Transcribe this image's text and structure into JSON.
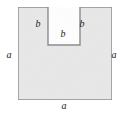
{
  "figure": {
    "kind": "geometry-diagram",
    "shape_name": "u-shaped-polygon",
    "colors": {
      "fill": "#e8e8e8",
      "stroke": "#8a8a8a",
      "label": "#1c1c1c",
      "background": "#ffffff"
    },
    "canvas": {
      "width": 122,
      "height": 115
    },
    "outline": {
      "outer_left": 18,
      "outer_right": 112,
      "outer_top": 7,
      "outer_bottom": 100,
      "notch_left": 48,
      "notch_right": 80,
      "notch_bottom": 45,
      "stroke_width": 1.4,
      "points": "18,7 48,7 48,45 80,45 80,7 112,7 112,100 18,100"
    },
    "labels": [
      {
        "id": "left-side",
        "text": "a",
        "x": 9,
        "y": 55
      },
      {
        "id": "right-side",
        "text": "a",
        "x": 114,
        "y": 55
      },
      {
        "id": "bottom-side",
        "text": "a",
        "x": 64,
        "y": 106
      },
      {
        "id": "notch-left-wall",
        "text": "b",
        "x": 38,
        "y": 24
      },
      {
        "id": "notch-right-wall",
        "text": "b",
        "x": 82,
        "y": 24
      },
      {
        "id": "notch-floor",
        "text": "b",
        "x": 63,
        "y": 34
      }
    ]
  }
}
